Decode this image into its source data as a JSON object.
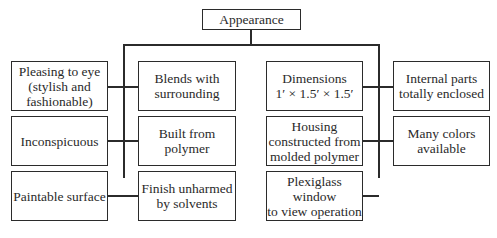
{
  "diagram": {
    "root": {
      "label": "Appearance"
    },
    "left_group": {
      "column_a": [
        {
          "label": "Pleasing to eye\n(stylish and\nfashionable)"
        },
        {
          "label": "Inconspicuous"
        },
        {
          "label": "Paintable surface"
        }
      ],
      "column_b": [
        {
          "label": "Blends with\nsurrounding"
        },
        {
          "label": "Built from\npolymer"
        },
        {
          "label": "Finish unharmed\nby solvents"
        }
      ]
    },
    "right_group": {
      "column_a": [
        {
          "label": "Dimensions\n1′ × 1.5′ × 1.5′"
        },
        {
          "label": "Housing\nconstructed from\nmolded polymer"
        },
        {
          "label": "Plexiglass window\nto view operation"
        }
      ],
      "column_b": [
        {
          "label": "Internal parts\ntotally enclosed"
        },
        {
          "label": "Many colors\navailable"
        }
      ]
    }
  }
}
